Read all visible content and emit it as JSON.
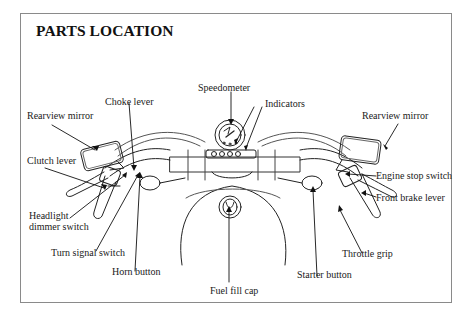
{
  "title": "PARTS LOCATION",
  "labels": {
    "speedometer": "Speedometer",
    "indicators": "Indicators",
    "choke_lever": "Choke lever",
    "rearview_mirror_left": "Rearview mirror",
    "rearview_mirror_right": "Rearview mirror",
    "clutch_lever": "Clutch lever",
    "headlight_dimmer_line1": "Headlight",
    "headlight_dimmer_line2": "dimmer switch",
    "turn_signal_switch": "Turn signal switch",
    "horn_button": "Horn button",
    "fuel_fill_cap": "Fuel fill cap",
    "starter_button": "Starter button",
    "throttle_grip": "Throttle grip",
    "engine_stop_switch": "Engine stop switch",
    "front_brake_lever": "Front brake lever"
  }
}
